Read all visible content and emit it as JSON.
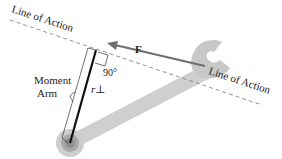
{
  "diagram": {
    "labels": {
      "line_of_action_left": "Line of Action",
      "line_of_action_right": "Line of Action",
      "force": "F",
      "right_angle": "90°",
      "moment_arm_line1": "Moment",
      "moment_arm_line2": "Arm",
      "r_perp": "r⊥"
    },
    "colors": {
      "wrench": "#c8c8c8",
      "wrench_pivot_outer": "#bdbdbd",
      "wrench_pivot_inner": "#8e8e8e",
      "force_arrow": "#6e6e6e",
      "moment_arm": "#111111",
      "dashed_line": "#777777",
      "text": "#222222"
    },
    "elements": [
      "line-of-action-dashed",
      "force-arrow",
      "wrench",
      "pivot",
      "moment-arm",
      "right-angle-marker",
      "brace"
    ]
  }
}
